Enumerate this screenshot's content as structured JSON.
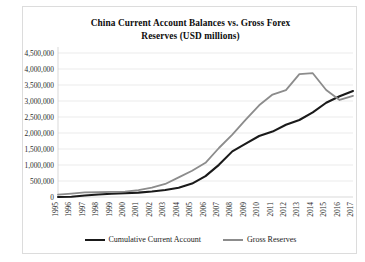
{
  "chart_data": {
    "type": "line",
    "title": "China Current Account Balances vs. Gross Forex Reserves (USD millions)",
    "title_line1": "China Current Account Balances vs. Gross Forex",
    "title_line2": "Reserves (USD millions)",
    "xlabel": "",
    "ylabel": "",
    "grid": true,
    "legend_position": "bottom",
    "ylim": [
      0,
      4500000
    ],
    "ytick_labels": [
      "4,500,000",
      "4,000,000",
      "3,500,000",
      "3,000,000",
      "2,500,000",
      "2,000,000",
      "1,500,000",
      "1,000,000",
      "500,000",
      "0"
    ],
    "ytick_values": [
      4500000,
      4000000,
      3500000,
      3000000,
      2500000,
      2000000,
      1500000,
      1000000,
      500000,
      0
    ],
    "categories": [
      "1995",
      "1996",
      "1997",
      "1998",
      "1999",
      "2000",
      "2001",
      "2002",
      "2003",
      "2004",
      "2005",
      "2006",
      "2007",
      "2008",
      "2009",
      "2010",
      "2011",
      "2012",
      "2013",
      "2014",
      "2015",
      "2016",
      "2017"
    ],
    "series": [
      {
        "name": "Cumulative Current Account",
        "color": "#1a1a1a",
        "width": 2.1,
        "values": [
          2000,
          9000,
          46000,
          78000,
          100000,
          121000,
          138000,
          173000,
          219000,
          288000,
          420000,
          652000,
          1005000,
          1426000,
          1669000,
          1907000,
          2043000,
          2258000,
          2406000,
          2642000,
          2946000,
          3148000,
          3313000
        ]
      },
      {
        "name": "Gross Reserves",
        "color": "#8c8c8c",
        "width": 1.8,
        "values": [
          75000,
          107000,
          143000,
          149000,
          158000,
          168000,
          216000,
          292000,
          408000,
          615000,
          822000,
          1069000,
          1531000,
          1950000,
          2416000,
          2866000,
          3202000,
          3341000,
          3840000,
          3869000,
          3345000,
          3032000,
          3160000
        ]
      }
    ]
  },
  "legend": {
    "entries": [
      {
        "label": "Cumulative Current Account",
        "color": "#1a1a1a"
      },
      {
        "label": "Gross Reserves",
        "color": "#8c8c8c"
      }
    ]
  }
}
